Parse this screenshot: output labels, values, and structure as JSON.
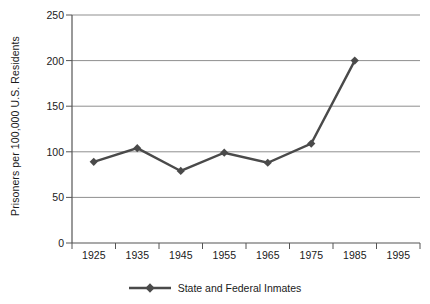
{
  "chart_data": {
    "type": "line",
    "title": "",
    "subtitle": "",
    "xlabel": "",
    "ylabel": "Prisoners per 100,000 U.S. Residents",
    "categories": [
      "1925",
      "1935",
      "1945",
      "1955",
      "1965",
      "1975",
      "1985",
      "1995"
    ],
    "series": [
      {
        "name": "State and Federal Inmates",
        "values": [
          89,
          104,
          79,
          99,
          88,
          109,
          200,
          null
        ],
        "color": "#4a4a4a",
        "marker": "diamond"
      }
    ],
    "ylim": [
      0,
      250
    ],
    "yticks": [
      0,
      50,
      100,
      150,
      200,
      250
    ],
    "ytick_labels": [
      "0",
      "50",
      "100",
      "150",
      "200",
      "250"
    ],
    "grid": "horizontal",
    "legend_position": "bottom",
    "legend_entries": [
      "State and Federal Inmates"
    ],
    "annotations": []
  },
  "colors": {
    "series": "#4a4a4a",
    "gridline": "#9a9a9a",
    "axis": "#4d4d4d",
    "text": "#1a1a1a",
    "background": "#ffffff"
  }
}
